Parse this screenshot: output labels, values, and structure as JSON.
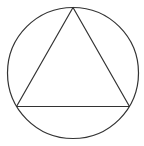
{
  "diagram": {
    "colors": {
      "stroke": "#333333",
      "background": "#ffffff"
    },
    "circle": {
      "cx": 73,
      "cy": 73,
      "r": 65.5
    },
    "triangle": {
      "vertices": [
        {
          "name": "top",
          "x": 73,
          "y": 7.5
        },
        {
          "name": "bottom-left",
          "x": 16.5,
          "y": 106.5
        },
        {
          "name": "bottom-right",
          "x": 129.5,
          "y": 106.5
        }
      ]
    }
  }
}
